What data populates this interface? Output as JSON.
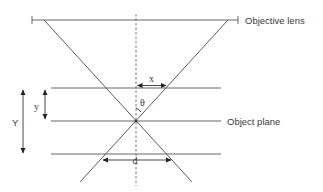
{
  "diagram": {
    "labels": {
      "objective_lens": "Objective lens",
      "object_plane": "Object plane",
      "x": "x",
      "theta": "θ",
      "y_small": "y",
      "y_large": "Y",
      "d": "d"
    },
    "colors": {
      "line": "#555555",
      "text": "#3a3a3a",
      "background": "#ffffff"
    }
  }
}
